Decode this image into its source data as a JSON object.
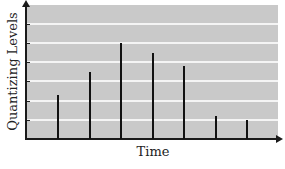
{
  "chart_data": {
    "type": "bar",
    "style": "stem",
    "title": "",
    "xlabel": "Time",
    "ylabel": "Quantizing Levels",
    "categories": [
      "t1",
      "t2",
      "t3",
      "t4",
      "t5",
      "t6",
      "t7"
    ],
    "values": [
      2.3,
      3.5,
      5.0,
      4.5,
      3.8,
      1.2,
      1.0
    ],
    "ylim": [
      0,
      7
    ],
    "grid_levels": [
      1,
      2,
      3,
      4,
      5,
      6
    ],
    "grid": true,
    "legend": null
  },
  "colors": {
    "plot_background": "#c9c9c9",
    "gridline": "#f4f4f4",
    "stem": "#111111",
    "axis": "#1a1a1a"
  }
}
